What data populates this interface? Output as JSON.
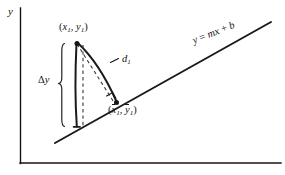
{
  "figure": {
    "background_color": "#ffffff",
    "ink_color": "#141414",
    "width": 285,
    "height": 175
  },
  "axes": {
    "y_axis_label": "y",
    "x_axis_label": "",
    "y_axis": {
      "x": 20,
      "y_top": 8,
      "y_bottom": 163
    },
    "x_axis": {
      "y": 163,
      "x_left": 20,
      "x_right": 281
    }
  },
  "regression_line": {
    "label_text": "y = mx + b",
    "label_y": "y",
    "label_equals": " = ",
    "label_m": "m",
    "label_x": "x",
    "label_plus": " + ",
    "label_b": "b",
    "x1": 55,
    "y1": 143,
    "x2": 271,
    "y2": 22,
    "rotation_deg": -21.5
  },
  "points": {
    "observed": {
      "label_open": "(",
      "label_x": "x",
      "label_x_sub": "1",
      "label_comma": ", ",
      "label_y": "y",
      "label_y_sub": "1",
      "label_close": ")",
      "cx": 76,
      "cy": 43
    },
    "predicted": {
      "label_open": "(",
      "label_x": "x",
      "label_x_sub": "1",
      "label_comma": ", ",
      "label_y": "y",
      "label_y_sub": "1",
      "label_close": ")",
      "cx": 116,
      "cy": 103
    }
  },
  "annotations": {
    "distance": {
      "label_d": "d",
      "label_sub": "1"
    },
    "delta_y": {
      "label_delta": "Δ",
      "label_y": "y"
    }
  },
  "markers": {
    "right_angle": "right-angle-marker",
    "brace": "delta-y-brace"
  }
}
